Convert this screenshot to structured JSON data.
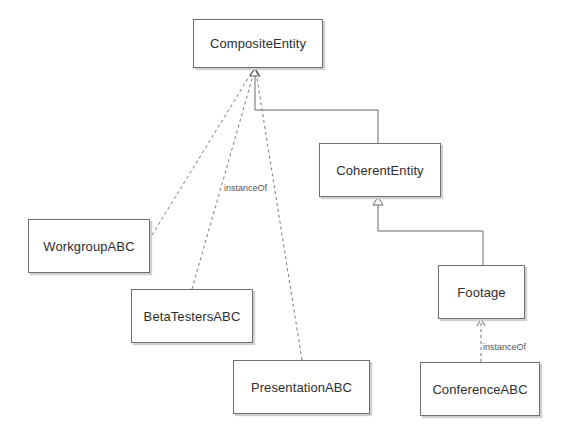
{
  "diagram": {
    "type": "uml-class-diagram",
    "nodes": [
      {
        "id": "composite",
        "label": "CompositeEntity"
      },
      {
        "id": "coherent",
        "label": "CoherentEntity"
      },
      {
        "id": "workgroup",
        "label": "WorkgroupABC"
      },
      {
        "id": "betatesters",
        "label": "BetaTestersABC"
      },
      {
        "id": "presentation",
        "label": "PresentationABC"
      },
      {
        "id": "footage",
        "label": "Footage"
      },
      {
        "id": "conference",
        "label": "ConferenceABC"
      }
    ],
    "edges": [
      {
        "from": "coherent",
        "to": "composite",
        "kind": "generalization",
        "style": "solid"
      },
      {
        "from": "footage",
        "to": "coherent",
        "kind": "generalization",
        "style": "solid"
      },
      {
        "from": "workgroup",
        "to": "composite",
        "kind": "dependency",
        "style": "dashed"
      },
      {
        "from": "betatesters",
        "to": "composite",
        "kind": "dependency",
        "style": "dashed",
        "label": "instanceOf"
      },
      {
        "from": "presentation",
        "to": "composite",
        "kind": "dependency",
        "style": "dashed"
      },
      {
        "from": "conference",
        "to": "footage",
        "kind": "dependency",
        "style": "dashed",
        "label": "instanceOf"
      }
    ],
    "edge_labels": {
      "betatesters_composite": "instanceOf",
      "conference_footage": "instanceOf"
    }
  }
}
